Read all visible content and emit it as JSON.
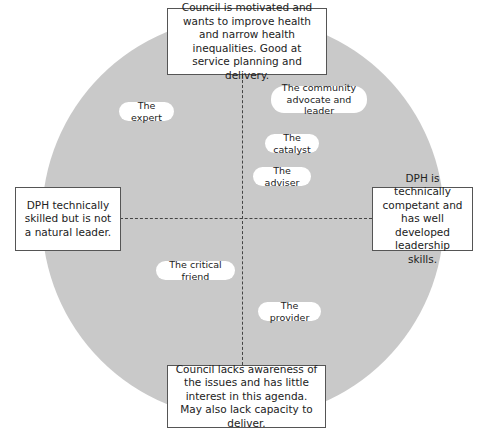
{
  "colors": {
    "circle_fill": "#c9c9c9",
    "box_border": "#555555",
    "dash_line": "#444444",
    "background": "#ffffff"
  },
  "axes": {
    "top": "Council is motivated and wants to improve health and narrow health inequalities. Good at service planning and delivery.",
    "bottom": "Council lacks awareness of the issues and has little interest in this agenda. May also lack capacity to deliver.",
    "left": "DPH technically skilled but is not a natural leader.",
    "right": "DPH is technically competant and has well developed leadership skills."
  },
  "roles": [
    {
      "label": "The expert",
      "quadrant": "top-left"
    },
    {
      "label": "The community advocate and leader",
      "quadrant": "top-right"
    },
    {
      "label": "The catalyst",
      "quadrant": "top-right"
    },
    {
      "label": "The adviser",
      "quadrant": "top-right"
    },
    {
      "label": "The critical friend",
      "quadrant": "bottom-left"
    },
    {
      "label": "The provider",
      "quadrant": "bottom-right"
    }
  ]
}
